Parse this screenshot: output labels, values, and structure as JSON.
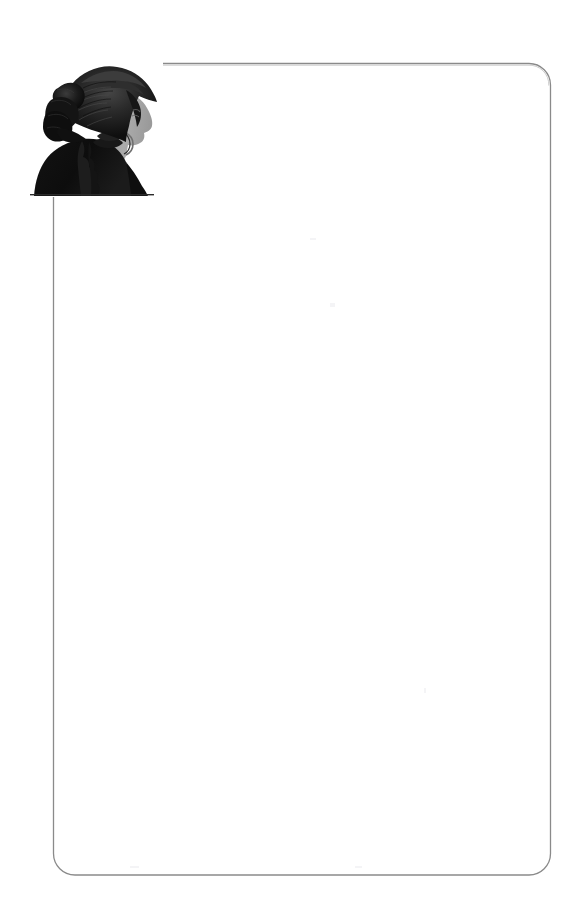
{
  "page": {
    "width": 579,
    "height": 909,
    "background_color": "#ffffff",
    "kind": "scanned-book-page",
    "body_text": "",
    "interior_note": ""
  },
  "frame": {
    "name": "rounded-rectangle-border",
    "stroke_color": "#8a8a8a",
    "stroke_width": 1.2,
    "corner_radius": 22,
    "left": 53,
    "top": 63,
    "right": 551,
    "bottom": 875,
    "fill": "none"
  },
  "portrait": {
    "title": "",
    "caption": "",
    "subject": "woman in profile wearing bonnet",
    "style": "engraved silhouette",
    "colors": {
      "silhouette": "#111111",
      "bonnet_shadow": "#1c1c1c",
      "bonnet_highlight": "#3a3a3a",
      "skin": "#a9a9a9",
      "skin_shadow": "#8e8e8e",
      "paper": "#ffffff",
      "baseline": "#2a2a2a"
    },
    "bounds": {
      "left": 27,
      "top": 38,
      "width": 136,
      "height": 159
    }
  },
  "icons": {
    "portrait_icon": "silhouette-portrait",
    "frame_icon": "rounded-rectangle"
  }
}
